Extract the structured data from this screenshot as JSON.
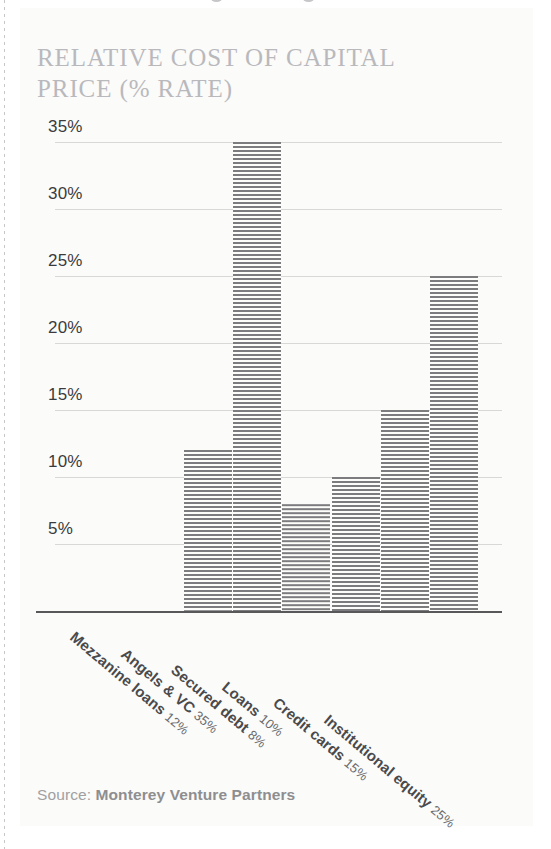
{
  "panel": {
    "title": "RELATIVE COST OF CAPITAL\nPRICE (% RATE)",
    "source_label": "Source: ",
    "source_org": "Monterey Venture Partners"
  },
  "chart_data": {
    "type": "bar",
    "title": "RELATIVE COST OF CAPITAL PRICE (% RATE)",
    "xlabel": "",
    "ylabel": "",
    "ylim": [
      0,
      37
    ],
    "grid": true,
    "legend": false,
    "categories": [
      "Mezzanine loans",
      "Angels & VC",
      "Secured debt",
      "Loans",
      "Credit cards",
      "Institutional equity"
    ],
    "values": [
      12,
      35,
      8,
      10,
      15,
      25
    ],
    "value_labels": [
      "12%",
      "35%",
      "8%",
      "10%",
      "15%",
      "25%"
    ],
    "ticks": [
      {
        "label": "35%",
        "value": 35
      },
      {
        "label": "30%",
        "value": 30
      },
      {
        "label": "25%",
        "value": 25
      },
      {
        "label": "20%",
        "value": 20
      },
      {
        "label": "15%",
        "value": 15
      },
      {
        "label": "10%",
        "value": 10
      },
      {
        "label": "5%",
        "value": 5
      }
    ],
    "bar_color": "#7c7c7e",
    "grid_color": "#d8d8d6",
    "axis_color": "#58585a"
  }
}
